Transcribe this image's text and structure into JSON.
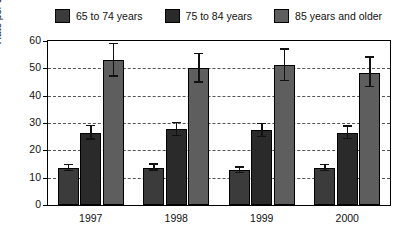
{
  "chart_data": {
    "type": "bar",
    "title": "",
    "subtitle": "",
    "xlabel": "",
    "ylabel": "Rate per 1000 population",
    "categories": [
      "1997",
      "1998",
      "1999",
      "2000"
    ],
    "ylim": [
      0,
      60
    ],
    "yticks": [
      0,
      10,
      20,
      30,
      40,
      50,
      60
    ],
    "grid": true,
    "legend_position": "top",
    "series": [
      {
        "name": "65 to 74 years",
        "color": "#3b3b3b",
        "values": [
          13.5,
          13.7,
          12.8,
          13.6
        ],
        "err_low": [
          12.3,
          12.5,
          11.7,
          12.3
        ],
        "err_high": [
          15.0,
          15.2,
          14.2,
          15.1
        ]
      },
      {
        "name": "75 to 84 years",
        "color": "#2a2a2a",
        "values": [
          26.5,
          27.8,
          27.3,
          26.5
        ],
        "err_low": [
          23.9,
          25.2,
          24.7,
          24.0
        ],
        "err_high": [
          29.3,
          30.4,
          30.0,
          29.2
        ]
      },
      {
        "name": "85 years and older",
        "color": "#5e5e5e",
        "values": [
          53.0,
          50.0,
          51.2,
          48.4
        ],
        "err_low": [
          47.0,
          44.8,
          45.4,
          43.0
        ],
        "err_high": [
          59.3,
          55.6,
          57.4,
          54.4
        ]
      }
    ]
  },
  "legend": {
    "items": [
      {
        "label": "65 to 74 years",
        "color": "#3b3b3b"
      },
      {
        "label": "75 to 84 years",
        "color": "#2a2a2a"
      },
      {
        "label": "85 years and older",
        "color": "#5e5e5e"
      }
    ]
  },
  "axes": {
    "y_title": "Rate per 1000 population",
    "y_tick_labels": [
      "60",
      "50",
      "40",
      "30",
      "20",
      "10",
      "0"
    ],
    "x_tick_labels": [
      "1997",
      "1998",
      "1999",
      "2000"
    ]
  }
}
